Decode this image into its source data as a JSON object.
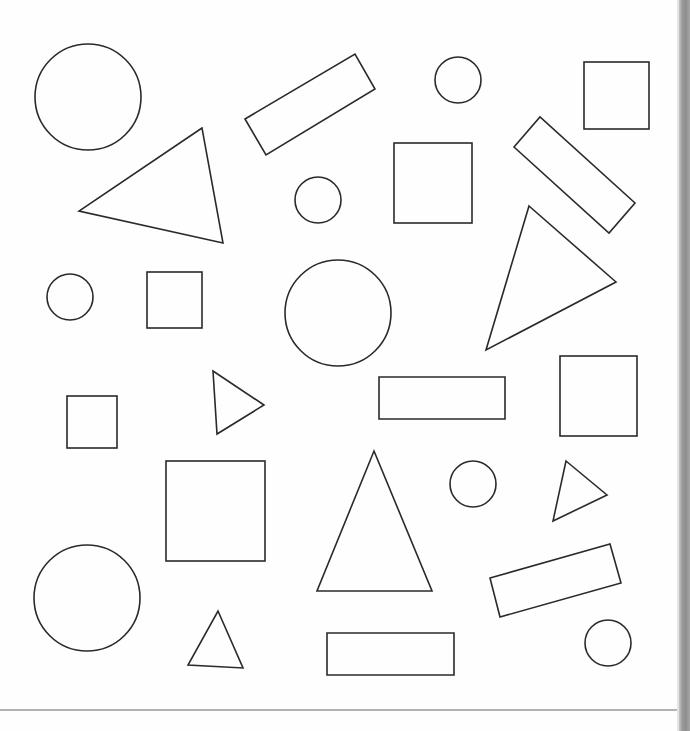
{
  "page": {
    "type": "worksheet-shapes",
    "background": "#fefefe",
    "stroke_color": "#2a2a2a",
    "spine_color": "#9a9a9a",
    "rule_color": "#b3b3b3"
  },
  "shapes": {
    "circles": [
      {
        "cx": 88,
        "cy": 97,
        "r": 53
      },
      {
        "cx": 458,
        "cy": 80,
        "r": 23
      },
      {
        "cx": 318,
        "cy": 200,
        "r": 23
      },
      {
        "cx": 70,
        "cy": 297,
        "r": 23
      },
      {
        "cx": 338,
        "cy": 313,
        "r": 53
      },
      {
        "cx": 473,
        "cy": 484,
        "r": 23
      },
      {
        "cx": 87,
        "cy": 598,
        "r": 53
      },
      {
        "cx": 608,
        "cy": 643,
        "r": 23
      }
    ],
    "squares": [
      {
        "x": 584,
        "y": 62,
        "w": 65,
        "h": 67
      },
      {
        "x": 394,
        "y": 143,
        "w": 78,
        "h": 80
      },
      {
        "x": 147,
        "y": 272,
        "w": 55,
        "h": 56
      },
      {
        "x": 67,
        "y": 396,
        "w": 50,
        "h": 52
      },
      {
        "x": 560,
        "y": 356,
        "w": 77,
        "h": 80
      },
      {
        "x": 166,
        "y": 461,
        "w": 99,
        "h": 100
      }
    ],
    "rectangles": [
      {
        "points": "245,119 355,54 375,89 266,155"
      },
      {
        "points": "514,147 540,117 635,203 609,233"
      },
      {
        "points": "379,377 505,377 505,419 379,419"
      },
      {
        "points": "490,578 610,544 621,583 500,617"
      },
      {
        "points": "327,633 454,633 454,675 327,675"
      }
    ],
    "triangles": [
      {
        "points": "202,128 79,211 223,243"
      },
      {
        "points": "529,206 616,282 486,350"
      },
      {
        "points": "213,371 264,405 217,434"
      },
      {
        "points": "566,461 607,495 553,521"
      },
      {
        "points": "374,451 432,591 317,591"
      },
      {
        "points": "218,611 243,668 188,665"
      }
    ]
  }
}
